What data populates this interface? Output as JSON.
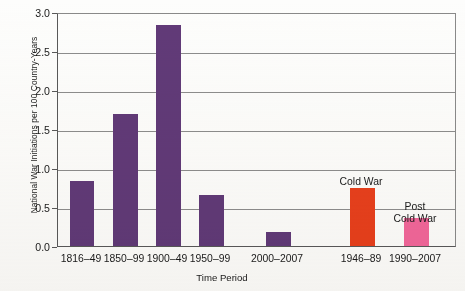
{
  "chart_data": {
    "type": "bar",
    "title": "",
    "xlabel": "Time Period",
    "ylabel": "National War Initiations per 100 Country-Years",
    "ylim": [
      0.0,
      3.0
    ],
    "ytick_labels": [
      "3.0",
      "2.5",
      "2.0",
      "1.5",
      "1.0",
      "0.5",
      "0.0"
    ],
    "ytick_values": [
      3.0,
      2.5,
      2.0,
      1.5,
      1.0,
      0.5,
      0.0
    ],
    "grid": "horizontal",
    "legend": "none",
    "categories": [
      "1816–49",
      "1850–99",
      "1900–49",
      "1950–99",
      "2000–2007",
      "1946–89",
      "1990–2007"
    ],
    "values": [
      0.83,
      1.69,
      2.83,
      0.65,
      0.18,
      0.75,
      0.36
    ],
    "bar_colors": [
      "#613a78",
      "#613a78",
      "#613a78",
      "#613a78",
      "#613a78",
      "#e8401c",
      "#f2679b"
    ],
    "annotations": [
      {
        "text": "Cold War",
        "category": "1946–89"
      },
      {
        "text": "Post\nCold War",
        "category": "1990–2007"
      }
    ],
    "colors": {
      "purple": "#613a78",
      "cold_war_red": "#e8401c",
      "post_cold_war_pink": "#f2679b",
      "grid": "#8d8d8d",
      "axis": "#595959",
      "background": "#fdfdfc",
      "text": "#1a1a1a"
    }
  }
}
